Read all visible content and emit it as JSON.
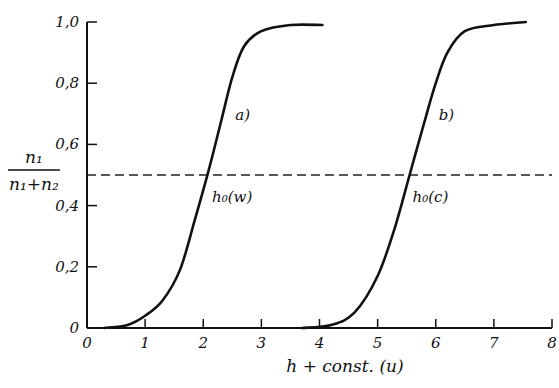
{
  "chart_data": {
    "type": "line",
    "title": "",
    "xlabel": "h + const. (u)",
    "ylabel": "n1 / (n1 + n2)",
    "ylabel_parts": {
      "numerator": "n₁",
      "denominator": "n₁+n₂"
    },
    "xlim": [
      0,
      8
    ],
    "ylim": [
      0,
      1.0
    ],
    "x_ticks": [
      "0",
      "1",
      "2",
      "3",
      "4",
      "5",
      "6",
      "7",
      "8"
    ],
    "y_ticks": [
      "0",
      "0,2",
      "0,4",
      "0,6",
      "0,8",
      "1,0"
    ],
    "grid": false,
    "legend": null,
    "reference_line": {
      "y": 0.5,
      "style": "dashed"
    },
    "series": [
      {
        "name": "a)",
        "midpoint_label": "h₀(w)",
        "midpoint_x": 2.1,
        "x": [
          0.3,
          0.7,
          1.0,
          1.3,
          1.6,
          1.85,
          2.1,
          2.3,
          2.5,
          2.7,
          3.0,
          3.5,
          4.05
        ],
        "y": [
          0.0,
          0.01,
          0.04,
          0.09,
          0.19,
          0.35,
          0.52,
          0.67,
          0.82,
          0.92,
          0.97,
          0.99,
          0.99
        ]
      },
      {
        "name": "b)",
        "midpoint_label": "h₀(c)",
        "midpoint_x": 5.55,
        "x": [
          3.7,
          4.2,
          4.6,
          5.0,
          5.3,
          5.55,
          5.8,
          6.0,
          6.2,
          6.5,
          7.0,
          7.55
        ],
        "y": [
          0.0,
          0.01,
          0.05,
          0.17,
          0.33,
          0.5,
          0.67,
          0.8,
          0.9,
          0.97,
          0.99,
          1.0
        ]
      }
    ]
  }
}
